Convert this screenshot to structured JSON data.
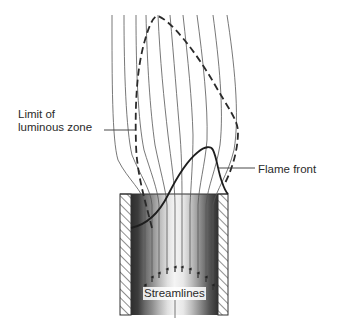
{
  "diagram": {
    "labels": {
      "luminous_line1": "Limit of",
      "luminous_line2": "luminous zone",
      "flame_front": "Flame front",
      "streamlines": "Streamlines"
    },
    "elements": [
      {
        "id": "burner-tube",
        "type": "tube with hatched walls"
      },
      {
        "id": "streamlines",
        "type": "thin curved lines",
        "count": 10,
        "direction": "upward"
      },
      {
        "id": "luminous-zone-boundary",
        "style": "dashed"
      },
      {
        "id": "flame-front",
        "style": "solid thick"
      }
    ],
    "colors": {
      "line": "#333333",
      "wall_hatch": "#444444",
      "tube_dark": "#3a3a3a",
      "tube_light": "#f2f2f2"
    }
  }
}
